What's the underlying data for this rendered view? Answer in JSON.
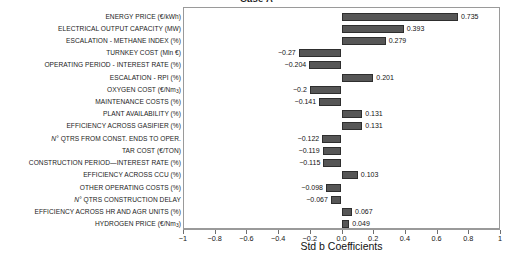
{
  "chart_data": {
    "type": "bar",
    "orientation": "horizontal",
    "title": "Case A",
    "xlabel": "Std b Coefficients",
    "ylabel": "",
    "xlim": [
      -1,
      1
    ],
    "xticks": [
      -1,
      -0.8,
      -0.6,
      -0.4,
      -0.2,
      0.0,
      0.2,
      0.4,
      0.6,
      0.8,
      1
    ],
    "xticklabels": [
      "-1",
      "-0.8",
      "-0.6",
      "-0.4",
      "-0.2",
      "0.0",
      "0.2",
      "0.4",
      "0.6",
      "0.8",
      "1"
    ],
    "grid": false,
    "legend": null,
    "bar_color": "#565656",
    "bar_edge_color": "#2e2e2e",
    "categories": [
      "ENERGY PRICE (€/kWh)",
      "ELECTRICAL OUTPUT CAPACITY (MW)",
      "ESCALATION - METHANE INDEX (%)",
      "TURNKEY COST (Mln €)",
      "OPERATING PERIOD - INTEREST RATE (%)",
      "ESCALATION - RPI  (%)",
      "OXYGEN COST (€/Nm3)",
      "MAINTENANCE COSTS (%)",
      "PLANT AVAILABILITY (%)",
      "EFFICIENCY ACROSS GASIFIER (%)",
      "N° QTRS FROM CONST. ENDS TO OPER.",
      "TAR COST (€/TON)",
      "CONSTRUCTION PERIOD—INTEREST RATE (%)",
      "EFFICIENCY ACROSS CCU (%)",
      "OTHER OPERATING COSTS (%)",
      "N° QTRS CONSTRUCTION DELAY",
      "EFFICIENCY ACROSS HR AND AGR UNITS (%)",
      "HYDROGEN PRICE (€/Nm3)"
    ],
    "values": [
      0.735,
      0.393,
      0.279,
      -0.27,
      -0.204,
      0.201,
      -0.2,
      -0.141,
      0.131,
      0.131,
      -0.122,
      -0.119,
      -0.115,
      0.103,
      -0.098,
      -0.067,
      0.067,
      0.049
    ],
    "value_labels": [
      "0.735",
      "0.393",
      "0.279",
      "-0.27",
      "-0.204",
      "0.201",
      "-0.2",
      "-0.141",
      "0.131",
      "0.131",
      "-0.122",
      "-0.119",
      "-0.115",
      "0.103",
      "-0.098",
      "-0.067",
      "0.067",
      "0.049"
    ]
  }
}
